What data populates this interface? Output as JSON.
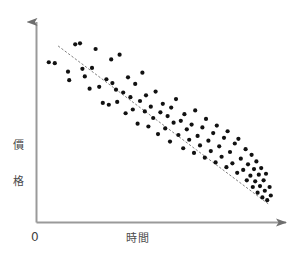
{
  "chart_data": {
    "type": "scatter",
    "title": "",
    "subtitle": "",
    "xlabel": "時間",
    "ylabel": "價格",
    "origin_label": "0",
    "grid": false,
    "legend": false,
    "legend_position": "none",
    "xlim": [
      0,
      100
    ],
    "ylim": [
      0,
      100
    ],
    "axis_ticks": [],
    "annotations": [],
    "point_color": "#111111",
    "axis_color": "#9a9a9a",
    "trendline_color": "#808080",
    "background_color": "#ffffff",
    "point_count": 95,
    "correlation": "negative",
    "trendline": {
      "style": "dotted",
      "x": [
        8.5,
        96.0
      ],
      "y": [
        92.5,
        9.0
      ]
    },
    "points": [
      {
        "x": 4.5,
        "y": 84.0
      },
      {
        "x": 7.0,
        "y": 83.5
      },
      {
        "x": 12.5,
        "y": 79.0
      },
      {
        "x": 13.0,
        "y": 74.5
      },
      {
        "x": 15.5,
        "y": 93.5
      },
      {
        "x": 17.5,
        "y": 94.0
      },
      {
        "x": 18.5,
        "y": 80.5
      },
      {
        "x": 19.5,
        "y": 76.5
      },
      {
        "x": 21.5,
        "y": 70.0
      },
      {
        "x": 22.5,
        "y": 81.0
      },
      {
        "x": 24.0,
        "y": 91.0
      },
      {
        "x": 25.5,
        "y": 71.0
      },
      {
        "x": 27.0,
        "y": 62.5
      },
      {
        "x": 28.5,
        "y": 75.0
      },
      {
        "x": 29.5,
        "y": 61.5
      },
      {
        "x": 30.5,
        "y": 85.5
      },
      {
        "x": 31.0,
        "y": 73.0
      },
      {
        "x": 32.5,
        "y": 69.5
      },
      {
        "x": 33.0,
        "y": 63.0
      },
      {
        "x": 34.0,
        "y": 88.0
      },
      {
        "x": 35.5,
        "y": 68.0
      },
      {
        "x": 36.5,
        "y": 57.0
      },
      {
        "x": 37.5,
        "y": 76.0
      },
      {
        "x": 38.5,
        "y": 65.5
      },
      {
        "x": 39.5,
        "y": 59.0
      },
      {
        "x": 40.5,
        "y": 72.5
      },
      {
        "x": 41.5,
        "y": 51.5
      },
      {
        "x": 42.5,
        "y": 63.5
      },
      {
        "x": 43.5,
        "y": 78.5
      },
      {
        "x": 44.5,
        "y": 58.0
      },
      {
        "x": 45.0,
        "y": 66.5
      },
      {
        "x": 46.0,
        "y": 50.0
      },
      {
        "x": 47.0,
        "y": 60.5
      },
      {
        "x": 48.0,
        "y": 54.5
      },
      {
        "x": 49.0,
        "y": 68.5
      },
      {
        "x": 50.0,
        "y": 46.0
      },
      {
        "x": 51.0,
        "y": 57.5
      },
      {
        "x": 52.0,
        "y": 62.0
      },
      {
        "x": 53.0,
        "y": 49.0
      },
      {
        "x": 54.0,
        "y": 55.5
      },
      {
        "x": 55.0,
        "y": 42.0
      },
      {
        "x": 55.5,
        "y": 60.0
      },
      {
        "x": 56.5,
        "y": 52.0
      },
      {
        "x": 57.5,
        "y": 64.5
      },
      {
        "x": 58.5,
        "y": 45.5
      },
      {
        "x": 59.5,
        "y": 53.0
      },
      {
        "x": 60.5,
        "y": 38.5
      },
      {
        "x": 61.0,
        "y": 56.5
      },
      {
        "x": 62.0,
        "y": 48.5
      },
      {
        "x": 63.0,
        "y": 43.0
      },
      {
        "x": 64.0,
        "y": 51.0
      },
      {
        "x": 65.0,
        "y": 36.0
      },
      {
        "x": 65.5,
        "y": 58.5
      },
      {
        "x": 66.5,
        "y": 45.0
      },
      {
        "x": 67.5,
        "y": 40.0
      },
      {
        "x": 68.5,
        "y": 49.5
      },
      {
        "x": 69.5,
        "y": 33.5
      },
      {
        "x": 70.0,
        "y": 54.0
      },
      {
        "x": 71.0,
        "y": 42.5
      },
      {
        "x": 72.0,
        "y": 37.0
      },
      {
        "x": 73.0,
        "y": 46.5
      },
      {
        "x": 74.0,
        "y": 31.0
      },
      {
        "x": 74.5,
        "y": 50.5
      },
      {
        "x": 75.5,
        "y": 39.5
      },
      {
        "x": 76.5,
        "y": 34.0
      },
      {
        "x": 77.5,
        "y": 44.0
      },
      {
        "x": 78.5,
        "y": 28.5
      },
      {
        "x": 79.0,
        "y": 47.5
      },
      {
        "x": 80.0,
        "y": 36.5
      },
      {
        "x": 81.0,
        "y": 30.5
      },
      {
        "x": 82.0,
        "y": 41.0
      },
      {
        "x": 83.0,
        "y": 25.5
      },
      {
        "x": 83.5,
        "y": 43.5
      },
      {
        "x": 84.5,
        "y": 33.0
      },
      {
        "x": 85.5,
        "y": 27.0
      },
      {
        "x": 86.5,
        "y": 38.0
      },
      {
        "x": 87.0,
        "y": 21.5
      },
      {
        "x": 87.5,
        "y": 30.0
      },
      {
        "x": 88.5,
        "y": 24.0
      },
      {
        "x": 89.0,
        "y": 35.0
      },
      {
        "x": 89.5,
        "y": 18.0
      },
      {
        "x": 90.0,
        "y": 27.5
      },
      {
        "x": 90.5,
        "y": 21.0
      },
      {
        "x": 91.0,
        "y": 31.5
      },
      {
        "x": 91.5,
        "y": 15.0
      },
      {
        "x": 92.0,
        "y": 24.5
      },
      {
        "x": 92.5,
        "y": 18.5
      },
      {
        "x": 93.0,
        "y": 28.0
      },
      {
        "x": 93.5,
        "y": 12.5
      },
      {
        "x": 94.0,
        "y": 21.5
      },
      {
        "x": 94.5,
        "y": 16.0
      },
      {
        "x": 95.0,
        "y": 25.0
      },
      {
        "x": 95.5,
        "y": 11.0
      },
      {
        "x": 96.5,
        "y": 18.0
      },
      {
        "x": 97.0,
        "y": 13.5
      }
    ]
  }
}
